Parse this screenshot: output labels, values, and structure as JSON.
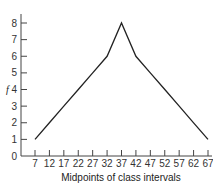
{
  "chart_data": {
    "type": "line",
    "title": "",
    "xlabel": "Midpoints of class intervals",
    "ylabel": "f",
    "x": [
      7,
      12,
      17,
      22,
      27,
      32,
      37,
      42,
      47,
      52,
      57,
      62,
      67
    ],
    "series": [
      {
        "name": "frequency polygon",
        "values": [
          1,
          2,
          3,
          4,
          5,
          6,
          8,
          6,
          5,
          4,
          3,
          2,
          1
        ]
      }
    ],
    "x_tick_labels": [
      "7",
      "12",
      "17",
      "22",
      "27",
      "32",
      "37",
      "42",
      "47",
      "52",
      "57",
      "62",
      "67"
    ],
    "y_tick_labels": [
      "0",
      "1",
      "2",
      "3",
      "4",
      "5",
      "6",
      "7",
      "8"
    ],
    "ylim": [
      0,
      8
    ],
    "xlim": [
      7,
      67
    ],
    "grid": false,
    "legend": false,
    "line_color": "#222222"
  }
}
